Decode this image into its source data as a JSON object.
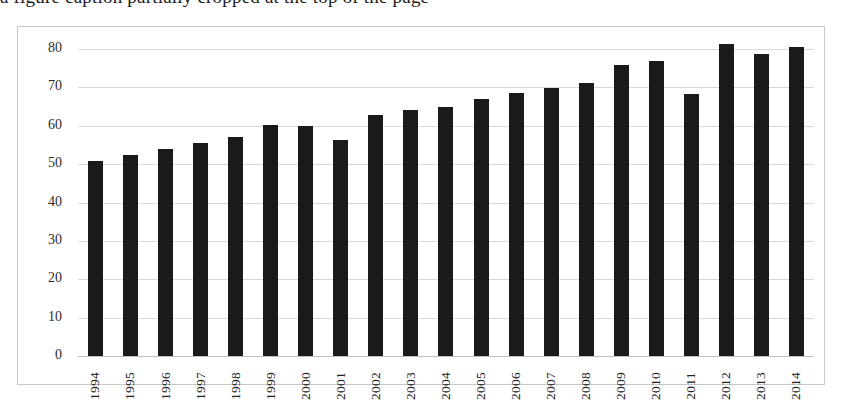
{
  "heading_remnant": "a figure caption partially cropped at the top of the page",
  "chart_data": {
    "type": "bar",
    "title": "",
    "xlabel": "",
    "ylabel": "",
    "categories": [
      "1994",
      "1995",
      "1996",
      "1997",
      "1998",
      "1999",
      "2000",
      "2001",
      "2002",
      "2003",
      "2004",
      "2005",
      "2006",
      "2007",
      "2008",
      "2009",
      "2010",
      "2011",
      "2012",
      "2013",
      "2014"
    ],
    "values": [
      50.7,
      52.3,
      54.0,
      55.4,
      57.2,
      60.3,
      60.0,
      56.2,
      62.7,
      64.1,
      64.8,
      66.9,
      68.5,
      69.8,
      71.2,
      75.8,
      77.0,
      68.4,
      81.3,
      78.8,
      80.5
    ],
    "ylim": [
      0,
      80
    ],
    "yticks": [
      0,
      10,
      20,
      30,
      40,
      50,
      60,
      70,
      80
    ],
    "ytick_labels": [
      "0",
      "10",
      "20",
      "30",
      "40",
      "50",
      "60",
      "70",
      "80"
    ],
    "grid": true,
    "legend": "none",
    "bar_color": "#1a1a1a",
    "grid_color": "#d9d9d9",
    "frame_color": "#c8c8c8",
    "background": "#ffffff"
  }
}
